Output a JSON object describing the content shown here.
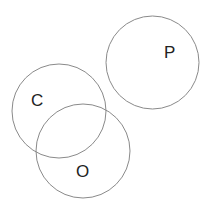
{
  "diagram": {
    "type": "venn",
    "stroke_color": "#8a8a8a",
    "text_color": "#222222",
    "sets": [
      {
        "id": "P",
        "label": "P",
        "cx": 152.5,
        "cy": 62.5,
        "r": 46.5,
        "label_x": 164,
        "label_y": 58
      },
      {
        "id": "C",
        "label": "C",
        "cx": 59,
        "cy": 111,
        "r": 47,
        "label_x": 31,
        "label_y": 106
      },
      {
        "id": "O",
        "label": "O",
        "cx": 83,
        "cy": 151,
        "r": 47,
        "label_x": 76,
        "label_y": 177
      }
    ]
  }
}
